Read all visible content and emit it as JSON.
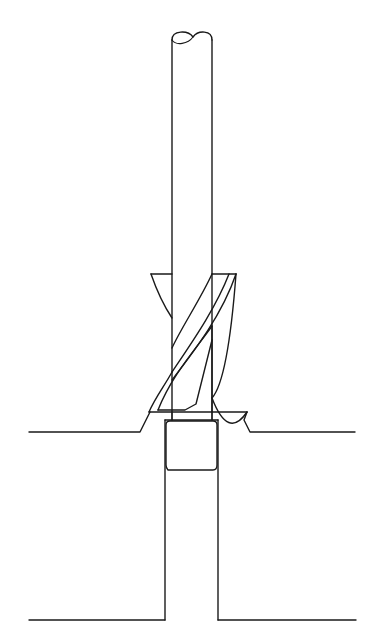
{
  "diagram": {
    "line_color": "#1a1a1a",
    "background": "#ffffff",
    "parts": [
      {
        "name": "shank",
        "description": "cylindrical shank with broken-off top"
      },
      {
        "name": "countersink-collar",
        "description": "conical countersink cutter"
      },
      {
        "name": "fluted-body",
        "description": "twisted drill flutes"
      },
      {
        "name": "pilot",
        "description": "pilot guide in bored hole"
      },
      {
        "name": "workpiece",
        "description": "material with countersunk hole"
      }
    ]
  }
}
